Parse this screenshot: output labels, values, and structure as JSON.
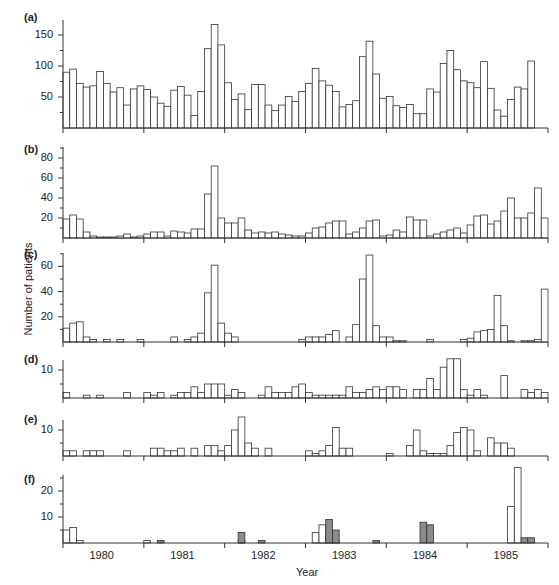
{
  "figure": {
    "ylabel": "Number of patients",
    "xlabel": "Year",
    "years": [
      "1980",
      "1981",
      "1982",
      "1983",
      "1984",
      "1985"
    ]
  },
  "colors": {
    "bar_fill": "#ffffff",
    "bar_stroke": "#333333",
    "shaded_fill": "#8a8a8a",
    "axis": "#333333"
  },
  "chart_data": [
    {
      "panel": "(a)",
      "type": "bar",
      "title": "",
      "xlabel": "",
      "ylabel": "Number of patients",
      "ylim": [
        0,
        170
      ],
      "yticks": [
        50,
        100,
        150
      ],
      "x_unit": "month",
      "x_start": "1980-01",
      "values": [
        90,
        95,
        72,
        66,
        68,
        91,
        72,
        58,
        65,
        37,
        63,
        68,
        62,
        50,
        40,
        35,
        61,
        67,
        53,
        20,
        59,
        128,
        167,
        134,
        73,
        46,
        55,
        30,
        70,
        70,
        37,
        28,
        37,
        51,
        43,
        59,
        72,
        96,
        76,
        69,
        59,
        34,
        38,
        44,
        115,
        140,
        87,
        48,
        51,
        36,
        33,
        38,
        23,
        23,
        63,
        58,
        104,
        125,
        94,
        76,
        73,
        65,
        107,
        64,
        29,
        19,
        46,
        66,
        63,
        108
      ]
    },
    {
      "panel": "(b)",
      "type": "bar",
      "ylim": [
        0,
        90
      ],
      "yticks": [
        20,
        40,
        60,
        80
      ],
      "x_unit": "month",
      "x_start": "1980-01",
      "values": [
        19,
        23,
        19,
        6,
        2,
        1,
        1,
        1,
        2,
        4,
        1,
        2,
        4,
        6,
        6,
        2,
        7,
        6,
        5,
        9,
        9,
        44,
        72,
        20,
        15,
        15,
        20,
        8,
        5,
        6,
        5,
        6,
        4,
        3,
        2,
        2,
        5,
        10,
        11,
        15,
        17,
        17,
        4,
        6,
        10,
        17,
        18,
        2,
        3,
        8,
        6,
        21,
        18,
        18,
        2,
        4,
        6,
        8,
        10,
        5,
        13,
        22,
        23,
        14,
        17,
        27,
        40,
        20,
        20,
        25,
        50,
        20
      ]
    },
    {
      "panel": "(c)",
      "type": "bar",
      "ylim": [
        0,
        70
      ],
      "yticks": [
        20,
        40,
        60
      ],
      "x_unit": "month",
      "x_start": "1980-01",
      "values": [
        11,
        15,
        16,
        4,
        2,
        0,
        2,
        0,
        2,
        0,
        0,
        2,
        0,
        0,
        0,
        0,
        4,
        0,
        2,
        4,
        7,
        39,
        61,
        15,
        7,
        4,
        0,
        0,
        0,
        0,
        0,
        0,
        0,
        0,
        0,
        2,
        4,
        4,
        4,
        6,
        9,
        0,
        4,
        14,
        50,
        69,
        13,
        4,
        4,
        1,
        1,
        0,
        0,
        0,
        2,
        0,
        0,
        0,
        0,
        2,
        3,
        8,
        9,
        10,
        37,
        13,
        1,
        0,
        1,
        1,
        2,
        42
      ]
    },
    {
      "panel": "(d)",
      "type": "bar",
      "ylim": [
        0,
        12
      ],
      "yticks": [
        10
      ],
      "x_unit": "month",
      "x_start": "1980-01",
      "values": [
        2,
        0,
        0,
        1,
        0,
        1,
        0,
        0,
        0,
        2,
        0,
        0,
        2,
        1,
        2,
        0,
        1,
        2,
        2,
        4,
        2,
        5,
        5,
        5,
        1,
        3,
        2,
        0,
        0,
        1,
        4,
        2,
        2,
        2,
        4,
        5,
        2,
        1,
        1,
        1,
        1,
        1,
        4,
        2,
        2,
        3,
        4,
        3,
        4,
        4,
        3,
        0,
        3,
        3,
        7,
        3,
        11,
        14,
        14,
        3,
        1,
        3,
        1,
        0,
        0,
        8,
        0,
        0,
        3,
        2,
        3,
        2
      ]
    },
    {
      "panel": "(e)",
      "type": "bar",
      "ylim": [
        0,
        14
      ],
      "yticks": [
        10
      ],
      "x_unit": "month",
      "x_start": "1980-01",
      "values": [
        2,
        2,
        0,
        2,
        2,
        2,
        0,
        0,
        0,
        2,
        0,
        0,
        0,
        3,
        3,
        2,
        2,
        3,
        0,
        3,
        0,
        4,
        4,
        2,
        4,
        10,
        15,
        5,
        3,
        0,
        3,
        0,
        0,
        0,
        0,
        0,
        2,
        1,
        2,
        4,
        11,
        3,
        3,
        0,
        0,
        0,
        0,
        0,
        1,
        0,
        0,
        4,
        10,
        2,
        1,
        1,
        1,
        4,
        9,
        11,
        10,
        2,
        0,
        7,
        5,
        5,
        3,
        0,
        0,
        0,
        0,
        0
      ]
    },
    {
      "panel": "(f)",
      "type": "bar",
      "ylim": [
        0,
        27
      ],
      "yticks": [
        10,
        20
      ],
      "x_unit": "month",
      "x_start": "1980-01",
      "series": [
        {
          "name": "unshaded",
          "values": [
            5,
            6,
            1,
            0,
            0,
            0,
            0,
            0,
            0,
            0,
            0,
            0,
            1,
            0,
            0,
            0,
            0,
            0,
            0,
            0,
            0,
            0,
            0,
            0,
            0,
            0,
            1,
            0,
            0,
            0,
            0,
            0,
            0,
            0,
            0,
            0,
            0,
            4,
            7,
            4,
            1,
            0,
            0,
            0,
            0,
            0,
            0,
            0,
            0,
            0,
            0,
            0,
            0,
            0,
            0,
            0,
            0,
            0,
            0,
            0,
            0,
            0,
            0,
            0,
            0,
            0,
            14,
            29,
            0,
            0,
            0,
            0
          ]
        },
        {
          "name": "shaded",
          "values": [
            0,
            0,
            0,
            0,
            0,
            0,
            0,
            0,
            0,
            0,
            0,
            0,
            0,
            0,
            1,
            0,
            0,
            0,
            0,
            0,
            0,
            0,
            0,
            0,
            0,
            0,
            4,
            0,
            0,
            1,
            0,
            0,
            0,
            0,
            0,
            0,
            0,
            0,
            0,
            9,
            5,
            0,
            0,
            0,
            0,
            0,
            1,
            0,
            0,
            0,
            0,
            0,
            0,
            8,
            7,
            0,
            0,
            0,
            0,
            0,
            0,
            0,
            0,
            0,
            0,
            0,
            0,
            0,
            2,
            2,
            0,
            0
          ]
        }
      ]
    }
  ]
}
